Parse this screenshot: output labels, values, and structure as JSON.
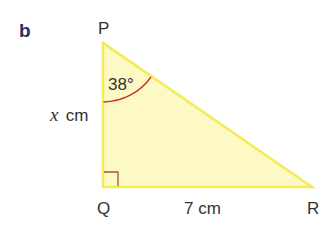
{
  "figure": {
    "part_label": "b",
    "part_label_color": "#2e2d63",
    "triangle": {
      "fill": "#fdf9c4",
      "stroke": "#f3ec55",
      "vertices": [
        {
          "name": "P",
          "label": "P"
        },
        {
          "name": "Q",
          "label": "Q"
        },
        {
          "name": "R",
          "label": "R"
        }
      ],
      "right_angle_at": "Q",
      "right_angle_marker_color": "#9a5a4a"
    },
    "angle": {
      "vertex": "P",
      "value": "38°",
      "arc_color": "#c8333a"
    },
    "sides": {
      "PQ": {
        "variable": "x",
        "unit": "cm"
      },
      "QR": {
        "label": "7 cm"
      }
    }
  }
}
